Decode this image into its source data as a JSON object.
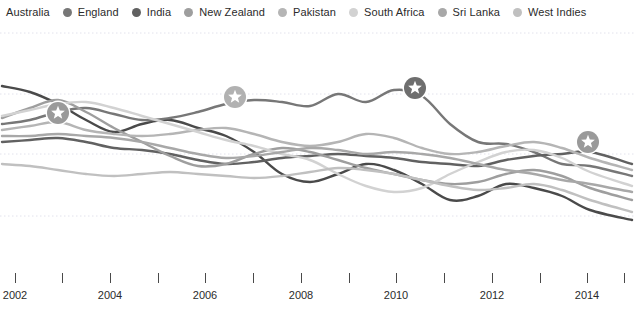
{
  "legend": {
    "position": "top",
    "items": [
      {
        "label": "Australia",
        "color": "#4a4a4a",
        "has_dot": false
      },
      {
        "label": "England",
        "color": "#777777",
        "has_dot": true
      },
      {
        "label": "India",
        "color": "#616161",
        "has_dot": true
      },
      {
        "label": "New Zealand",
        "color": "#9e9e9e",
        "has_dot": true
      },
      {
        "label": "Pakistan",
        "color": "#b5b5b5",
        "has_dot": true
      },
      {
        "label": "South Africa",
        "color": "#d2d2d2",
        "has_dot": true
      },
      {
        "label": "Sri Lanka",
        "color": "#a8a8a8",
        "has_dot": true
      },
      {
        "label": "West Indies",
        "color": "#c0c0c0",
        "has_dot": true
      }
    ]
  },
  "axis": {
    "ticks": [
      {
        "x": 15,
        "label": "2002"
      },
      {
        "x": 62,
        "label": ""
      },
      {
        "x": 110,
        "label": "2004"
      },
      {
        "x": 158,
        "label": ""
      },
      {
        "x": 205,
        "label": "2006"
      },
      {
        "x": 253,
        "label": ""
      },
      {
        "x": 301,
        "label": "2008"
      },
      {
        "x": 349,
        "label": ""
      },
      {
        "x": 396,
        "label": "2010"
      },
      {
        "x": 444,
        "label": ""
      },
      {
        "x": 492,
        "label": "2012"
      },
      {
        "x": 540,
        "label": ""
      },
      {
        "x": 587,
        "label": "2014"
      },
      {
        "x": 624,
        "label": ""
      }
    ]
  },
  "gridlines": {
    "y": [
      9,
      70,
      130,
      192
    ],
    "color": "#e2e2ec",
    "style": "dotted"
  },
  "markers": [
    {
      "team": "Australia",
      "x": 58,
      "y": 89,
      "color": "#9a9a9a",
      "glyph": "star"
    },
    {
      "team": "Australia",
      "x": 235,
      "y": 73,
      "color": "#b1b1b1",
      "glyph": "star"
    },
    {
      "team": "India",
      "x": 415,
      "y": 64,
      "color": "#6e6e6e",
      "glyph": "star"
    },
    {
      "team": "India",
      "x": 588,
      "y": 118,
      "color": "#9a9a9a",
      "glyph": "star"
    }
  ],
  "chart_data": {
    "type": "line",
    "title": "",
    "xlabel": "",
    "ylabel": "",
    "xlim": [
      2001.7,
      2015.2
    ],
    "ylim": [
      0,
      1
    ],
    "grid": true,
    "legend_position": "top",
    "x": [
      2002.0,
      2002.5,
      2003.0,
      2003.5,
      2004.0,
      2004.5,
      2005.0,
      2005.5,
      2006.0,
      2006.5,
      2007.0,
      2007.5,
      2008.0,
      2008.5,
      2009.0,
      2009.5,
      2010.0,
      2010.5,
      2011.0,
      2011.5,
      2012.0,
      2012.5,
      2013.0,
      2013.5,
      2014.0,
      2014.5,
      2015.0
    ],
    "series": [
      {
        "name": "Australia",
        "color": "#4a4a4a",
        "width": 2.4,
        "points_px": [
          [
            2,
            62
          ],
          [
            30,
            68
          ],
          [
            58,
            80
          ],
          [
            86,
            96
          ],
          [
            114,
            108
          ],
          [
            142,
            100
          ],
          [
            170,
            96
          ],
          [
            198,
            104
          ],
          [
            226,
            112
          ],
          [
            254,
            128
          ],
          [
            282,
            150
          ],
          [
            310,
            158
          ],
          [
            338,
            150
          ],
          [
            366,
            140
          ],
          [
            394,
            146
          ],
          [
            422,
            160
          ],
          [
            450,
            176
          ],
          [
            478,
            172
          ],
          [
            506,
            160
          ],
          [
            534,
            164
          ],
          [
            562,
            172
          ],
          [
            590,
            186
          ],
          [
            632,
            196
          ]
        ]
      },
      {
        "name": "England",
        "color": "#777777",
        "width": 2.4,
        "points_px": [
          [
            2,
            100
          ],
          [
            30,
            96
          ],
          [
            58,
            88
          ],
          [
            86,
            84
          ],
          [
            114,
            90
          ],
          [
            142,
            96
          ],
          [
            170,
            94
          ],
          [
            198,
            88
          ],
          [
            226,
            80
          ],
          [
            254,
            76
          ],
          [
            282,
            78
          ],
          [
            310,
            82
          ],
          [
            338,
            70
          ],
          [
            366,
            78
          ],
          [
            394,
            66
          ],
          [
            422,
            72
          ],
          [
            450,
            100
          ],
          [
            478,
            118
          ],
          [
            506,
            120
          ],
          [
            534,
            128
          ],
          [
            562,
            140
          ],
          [
            590,
            142
          ],
          [
            632,
            152
          ]
        ]
      },
      {
        "name": "India",
        "color": "#616161",
        "width": 2.4,
        "points_px": [
          [
            2,
            118
          ],
          [
            30,
            116
          ],
          [
            58,
            114
          ],
          [
            86,
            118
          ],
          [
            114,
            124
          ],
          [
            142,
            126
          ],
          [
            170,
            130
          ],
          [
            198,
            136
          ],
          [
            226,
            140
          ],
          [
            254,
            138
          ],
          [
            282,
            134
          ],
          [
            310,
            132
          ],
          [
            338,
            130
          ],
          [
            366,
            132
          ],
          [
            394,
            134
          ],
          [
            422,
            138
          ],
          [
            450,
            140
          ],
          [
            478,
            142
          ],
          [
            506,
            136
          ],
          [
            534,
            132
          ],
          [
            562,
            130
          ],
          [
            590,
            128
          ],
          [
            632,
            140
          ]
        ]
      },
      {
        "name": "New Zealand",
        "color": "#9e9e9e",
        "width": 2.4,
        "points_px": [
          [
            2,
            94
          ],
          [
            30,
            84
          ],
          [
            58,
            76
          ],
          [
            86,
            88
          ],
          [
            114,
            104
          ],
          [
            142,
            118
          ],
          [
            170,
            132
          ],
          [
            198,
            142
          ],
          [
            226,
            140
          ],
          [
            254,
            130
          ],
          [
            282,
            124
          ],
          [
            310,
            128
          ],
          [
            338,
            136
          ],
          [
            366,
            144
          ],
          [
            394,
            150
          ],
          [
            422,
            156
          ],
          [
            450,
            160
          ],
          [
            478,
            158
          ],
          [
            506,
            150
          ],
          [
            534,
            146
          ],
          [
            562,
            152
          ],
          [
            590,
            164
          ],
          [
            632,
            176
          ]
        ]
      },
      {
        "name": "Pakistan",
        "color": "#b5b5b5",
        "width": 2.4,
        "points_px": [
          [
            2,
            106
          ],
          [
            30,
            102
          ],
          [
            58,
            98
          ],
          [
            86,
            106
          ],
          [
            114,
            110
          ],
          [
            142,
            112
          ],
          [
            170,
            110
          ],
          [
            198,
            106
          ],
          [
            226,
            104
          ],
          [
            254,
            110
          ],
          [
            282,
            118
          ],
          [
            310,
            122
          ],
          [
            338,
            118
          ],
          [
            366,
            110
          ],
          [
            394,
            114
          ],
          [
            422,
            124
          ],
          [
            450,
            130
          ],
          [
            478,
            128
          ],
          [
            506,
            122
          ],
          [
            534,
            118
          ],
          [
            562,
            124
          ],
          [
            590,
            134
          ],
          [
            632,
            146
          ]
        ]
      },
      {
        "name": "South Africa",
        "color": "#d2d2d2",
        "width": 2.4,
        "points_px": [
          [
            2,
            92
          ],
          [
            30,
            86
          ],
          [
            58,
            80
          ],
          [
            86,
            78
          ],
          [
            114,
            84
          ],
          [
            142,
            92
          ],
          [
            170,
            100
          ],
          [
            198,
            108
          ],
          [
            226,
            116
          ],
          [
            254,
            122
          ],
          [
            282,
            130
          ],
          [
            310,
            136
          ],
          [
            338,
            150
          ],
          [
            366,
            162
          ],
          [
            394,
            168
          ],
          [
            422,
            164
          ],
          [
            450,
            150
          ],
          [
            478,
            138
          ],
          [
            506,
            128
          ],
          [
            534,
            126
          ],
          [
            562,
            134
          ],
          [
            590,
            148
          ],
          [
            632,
            162
          ]
        ]
      },
      {
        "name": "Sri Lanka",
        "color": "#a8a8a8",
        "width": 2.4,
        "points_px": [
          [
            2,
            112
          ],
          [
            30,
            112
          ],
          [
            58,
            110
          ],
          [
            86,
            112
          ],
          [
            114,
            114
          ],
          [
            142,
            118
          ],
          [
            170,
            124
          ],
          [
            198,
            130
          ],
          [
            226,
            134
          ],
          [
            254,
            132
          ],
          [
            282,
            128
          ],
          [
            310,
            124
          ],
          [
            338,
            126
          ],
          [
            366,
            130
          ],
          [
            394,
            128
          ],
          [
            422,
            130
          ],
          [
            450,
            134
          ],
          [
            478,
            140
          ],
          [
            506,
            146
          ],
          [
            534,
            150
          ],
          [
            562,
            156
          ],
          [
            590,
            160
          ],
          [
            632,
            168
          ]
        ]
      },
      {
        "name": "West Indies",
        "color": "#c0c0c0",
        "width": 2.4,
        "points_px": [
          [
            2,
            140
          ],
          [
            30,
            142
          ],
          [
            58,
            146
          ],
          [
            86,
            150
          ],
          [
            114,
            152
          ],
          [
            142,
            150
          ],
          [
            170,
            148
          ],
          [
            198,
            150
          ],
          [
            226,
            152
          ],
          [
            254,
            154
          ],
          [
            282,
            152
          ],
          [
            310,
            148
          ],
          [
            338,
            144
          ],
          [
            366,
            146
          ],
          [
            394,
            150
          ],
          [
            422,
            156
          ],
          [
            450,
            162
          ],
          [
            478,
            166
          ],
          [
            506,
            164
          ],
          [
            534,
            160
          ],
          [
            562,
            166
          ],
          [
            590,
            176
          ],
          [
            632,
            188
          ]
        ]
      }
    ]
  }
}
